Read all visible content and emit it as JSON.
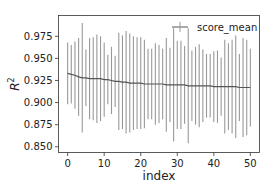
{
  "chart_data": {
    "type": "line",
    "title": "",
    "xlabel": "index",
    "ylabel": "R^2",
    "ylabel_display": {
      "base": "R",
      "sup": "2"
    },
    "xlim": [
      -2.5,
      52.5
    ],
    "ylim": [
      0.8435,
      0.9985
    ],
    "xticks": [
      0,
      10,
      20,
      30,
      40,
      50
    ],
    "xtick_labels": [
      "0",
      "10",
      "20",
      "30",
      "40",
      "50"
    ],
    "yticks": [
      0.85,
      0.875,
      0.9,
      0.925,
      0.95,
      0.975
    ],
    "ytick_labels": [
      "0.850",
      "0.875",
      "0.900",
      "0.925",
      "0.950",
      "0.975"
    ],
    "grid": false,
    "legend": {
      "position": "upper right",
      "entries": [
        "score_mean"
      ]
    },
    "series": [
      {
        "name": "score_mean",
        "color": "#555555",
        "errorbar_color": "#999999",
        "x": [
          0,
          1,
          2,
          3,
          4,
          5,
          6,
          7,
          8,
          9,
          10,
          11,
          12,
          13,
          14,
          15,
          16,
          17,
          18,
          19,
          20,
          21,
          22,
          23,
          24,
          25,
          26,
          27,
          28,
          29,
          30,
          31,
          32,
          33,
          34,
          35,
          36,
          37,
          38,
          39,
          40,
          41,
          42,
          43,
          44,
          45,
          46,
          47,
          48,
          49,
          50
        ],
        "values": [
          0.933,
          0.932,
          0.931,
          0.929,
          0.928,
          0.928,
          0.927,
          0.927,
          0.927,
          0.927,
          0.926,
          0.926,
          0.925,
          0.924,
          0.924,
          0.923,
          0.923,
          0.922,
          0.922,
          0.922,
          0.922,
          0.921,
          0.921,
          0.921,
          0.921,
          0.921,
          0.921,
          0.92,
          0.92,
          0.92,
          0.92,
          0.92,
          0.92,
          0.919,
          0.919,
          0.919,
          0.919,
          0.919,
          0.919,
          0.919,
          0.918,
          0.918,
          0.918,
          0.918,
          0.918,
          0.918,
          0.918,
          0.917,
          0.917,
          0.917,
          0.917
        ],
        "errors": [
          0.035,
          0.033,
          0.038,
          0.044,
          0.062,
          0.032,
          0.046,
          0.047,
          0.05,
          0.048,
          0.042,
          0.028,
          0.038,
          0.029,
          0.055,
          0.053,
          0.058,
          0.056,
          0.053,
          0.052,
          0.052,
          0.05,
          0.04,
          0.04,
          0.046,
          0.044,
          0.04,
          0.053,
          0.042,
          0.064,
          0.05,
          0.05,
          0.044,
          0.065,
          0.04,
          0.044,
          0.047,
          0.041,
          0.036,
          0.036,
          0.04,
          0.041,
          0.033,
          0.053,
          0.049,
          0.053,
          0.058,
          0.038,
          0.056,
          0.054,
          0.044
        ]
      }
    ]
  }
}
